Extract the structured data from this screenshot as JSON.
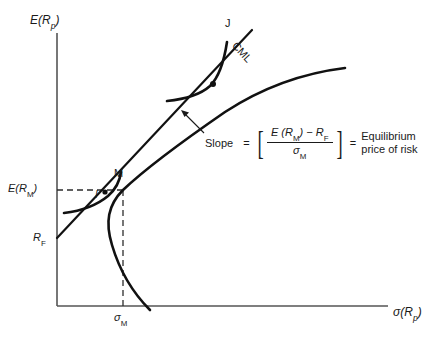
{
  "figure": {
    "axes": {
      "y_label_main": "E",
      "y_label_arg": "(R",
      "y_label_sub": "p",
      "y_label_close": ")",
      "y_label_full": "E (Rp)",
      "x_label_main": "σ(R",
      "x_label_sub": "p",
      "x_label_close": ")",
      "x_label_full": "σ(Rp)"
    },
    "ticks": {
      "y_tick_main": "E(R",
      "y_tick_sub": "M",
      "y_tick_close": ")",
      "y_tick_full": "E(RM)",
      "y_intercept_main": "R",
      "y_intercept_sub": "F",
      "y_intercept_full": "RF",
      "x_tick_main": "σ",
      "x_tick_sub": "M",
      "x_tick_full": "σM"
    },
    "markers": {
      "market_portfolio": "M",
      "indifference_curve_lower": "I",
      "indifference_curve_upper": "J",
      "capital_market_line": "CML"
    },
    "annotation": {
      "slope_word": "Slope",
      "equals_1": "=",
      "bracket_open": "[",
      "bracket_close": "]",
      "numerator_lead": "E (R",
      "numerator_sub_1": "M",
      "numerator_mid": ") − R",
      "numerator_sub_2": "F",
      "numerator_full": "E (RM) − RF",
      "denominator_lead": "σ",
      "denominator_sub": "M",
      "denominator_full": "σM",
      "equals_2": "=",
      "result_line_1": "Equilibrium",
      "result_line_2": "price of risk"
    },
    "colors": {
      "axis": "#555555",
      "curve": "#111111",
      "dashed": "#3a3a3a",
      "text": "#1a1a1a",
      "background": "#ffffff"
    }
  }
}
